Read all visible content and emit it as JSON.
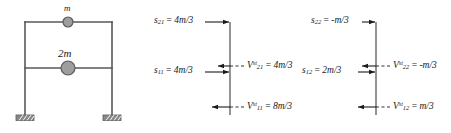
{
  "figure": {
    "type": "structural-free-body-diagram",
    "stroke_color": "#595959",
    "text_color": "#1a1a1a",
    "mass_fill": "#9e9e9e"
  },
  "frame": {
    "name": "two-story-shear-frame",
    "masses": [
      {
        "id": "top-mass",
        "label": "m"
      },
      {
        "id": "mid-mass",
        "label": "2m"
      }
    ],
    "supports": [
      {
        "id": "left-support",
        "type": "fixed"
      },
      {
        "id": "right-support",
        "type": "fixed"
      }
    ]
  },
  "fbd1": {
    "name": "first-mode-free-body",
    "equations": {
      "top_stiffness": {
        "symbol": "s",
        "sub": "21",
        "value": "4m/3"
      },
      "mid_stiffness": {
        "symbol": "s",
        "sub": "11",
        "value": "4m/3"
      },
      "top_shear": {
        "symbol": "V",
        "sub": "21",
        "sup": "st",
        "value": "4m/3"
      },
      "base_shear": {
        "symbol": "V",
        "sub": "11",
        "sup": "st",
        "value": "8m/3"
      }
    }
  },
  "fbd2": {
    "name": "second-mode-free-body",
    "equations": {
      "top_stiffness": {
        "symbol": "s",
        "sub": "22",
        "value": "-m/3"
      },
      "mid_stiffness": {
        "symbol": "s",
        "sub": "12",
        "value": "2m/3"
      },
      "top_shear": {
        "symbol": "V",
        "sub": "22",
        "sup": "st",
        "value": "-m/3"
      },
      "base_shear": {
        "symbol": "V",
        "sub": "12",
        "sup": "st",
        "value": "m/3"
      }
    }
  }
}
